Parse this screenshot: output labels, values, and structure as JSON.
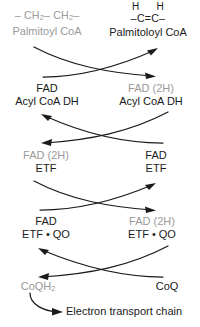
{
  "diagram": {
    "colors": {
      "oxidized_black": "#1b1b1b",
      "reduced_grey": "#9a9a9a",
      "background": "#ffffff"
    },
    "substrate": {
      "left": {
        "formula_text": "– CH2 – CH2 –",
        "formula_parts": [
          "–",
          "CH",
          "2",
          "–",
          "CH",
          "2",
          "–"
        ],
        "name": "Palmitoyl CoA",
        "color": "#9a9a9a"
      },
      "right": {
        "hydrogens": "H   H",
        "formula_text": "–C=C–",
        "name": "Palmitoloyl CoA",
        "color": "#1b1b1b"
      }
    },
    "pairs": [
      {
        "id": "acyl-coa-dh",
        "left_top": "FAD",
        "left_bottom": "Acyl CoA DH",
        "left_top_color": "#1b1b1b",
        "right_top": "FAD (2H)",
        "right_bottom": "Acyl CoA DH",
        "right_top_color": "#9a9a9a"
      },
      {
        "id": "etf",
        "left_top": "FAD (2H)",
        "left_bottom": "ETF",
        "left_top_color": "#9a9a9a",
        "right_top": "FAD",
        "right_bottom": "ETF",
        "right_top_color": "#1b1b1b"
      },
      {
        "id": "etf-qo",
        "left_top": "FAD",
        "left_bottom": "ETF • QO",
        "left_top_color": "#1b1b1b",
        "right_top": "FAD (2H)",
        "right_bottom": "ETF • QO",
        "right_top_color": "#9a9a9a"
      }
    ],
    "quinone": {
      "left_name": "CoQH",
      "left_sub": "2",
      "left_color": "#9a9a9a",
      "right_name": "CoQ",
      "right_color": "#1b1b1b"
    },
    "outflow": {
      "label": "Electron transport chain"
    }
  }
}
